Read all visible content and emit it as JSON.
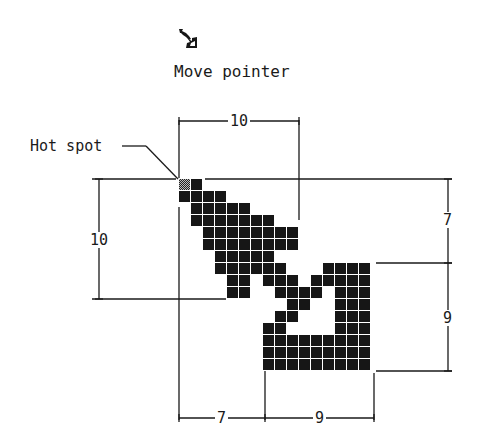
{
  "icon": {
    "name": "move-pointer-icon",
    "caption": "Move pointer"
  },
  "labels": {
    "hot_spot": "Hot spot",
    "top_width": "10",
    "left_height": "10",
    "right_upper_height": "7",
    "right_lower_height": "9",
    "bottom_left_width": "7",
    "bottom_right_width": "9"
  },
  "colors": {
    "pixel": "#161616",
    "line": "#1a1a1a",
    "background": "#ffffff"
  },
  "grid": {
    "cell_size": 12,
    "hot_spot": [
      0,
      0
    ],
    "rows": [
      [
        [
          0,
          0,
          "hot"
        ],
        [
          1,
          1
        ]
      ],
      [
        [
          0,
          3
        ]
      ],
      [
        [
          1,
          5
        ]
      ],
      [
        [
          1,
          7
        ]
      ],
      [
        [
          2,
          9
        ]
      ],
      [
        [
          2,
          9
        ]
      ],
      [
        [
          3,
          7
        ]
      ],
      [
        [
          3,
          8
        ],
        [
          12,
          15
        ]
      ],
      [
        [
          4,
          5
        ],
        [
          7,
          9
        ],
        [
          11,
          15
        ]
      ],
      [
        [
          4,
          5
        ],
        [
          8,
          11
        ],
        [
          13,
          15
        ]
      ],
      [
        [
          9,
          10
        ],
        [
          13,
          15
        ]
      ],
      [
        [
          8,
          9
        ],
        [
          13,
          15
        ]
      ],
      [
        [
          7,
          8
        ],
        [
          13,
          15
        ]
      ],
      [
        [
          7,
          15
        ]
      ],
      [
        [
          7,
          15
        ]
      ],
      [
        [
          7,
          15
        ]
      ]
    ]
  }
}
